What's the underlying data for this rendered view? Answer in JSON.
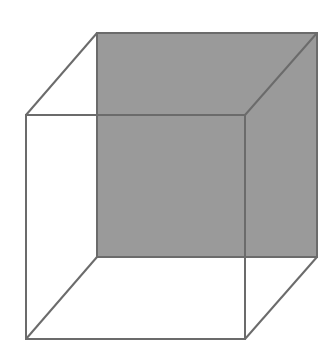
{
  "diagram": {
    "colors": {
      "background": "#ffffff",
      "edge": "#6b6b6b",
      "shaded_face": "#9a9a9a"
    },
    "back_face": {
      "points": "97,33 317,33 317,257 97,257",
      "shaded": true
    },
    "front_face": {
      "points": "26,115 245,115 245,339 26,339",
      "shaded": false
    },
    "connecting_edges": [
      {
        "x1": 26,
        "y1": 115,
        "x2": 97,
        "y2": 33
      },
      {
        "x1": 245,
        "y1": 115,
        "x2": 317,
        "y2": 33
      },
      {
        "x1": 245,
        "y1": 339,
        "x2": 317,
        "y2": 257
      },
      {
        "x1": 26,
        "y1": 339,
        "x2": 97,
        "y2": 257
      }
    ]
  }
}
